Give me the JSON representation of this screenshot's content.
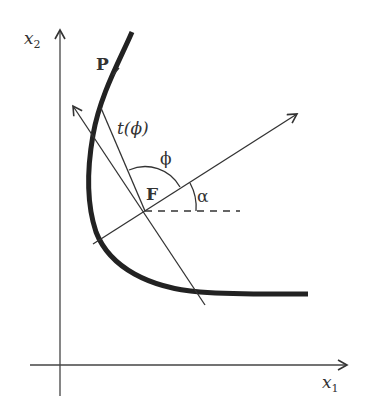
{
  "diagram": {
    "labels": {
      "x2_axis": "x",
      "x2_sub": "2",
      "x1_axis": "x",
      "x1_sub": "1",
      "point_P": "P",
      "point_F": "F",
      "t_phi": "t(ϕ)",
      "phi": "ϕ",
      "alpha": "α"
    },
    "colors": {
      "ink": "#333333",
      "curve": "#222222",
      "background": "#ffffff"
    }
  }
}
